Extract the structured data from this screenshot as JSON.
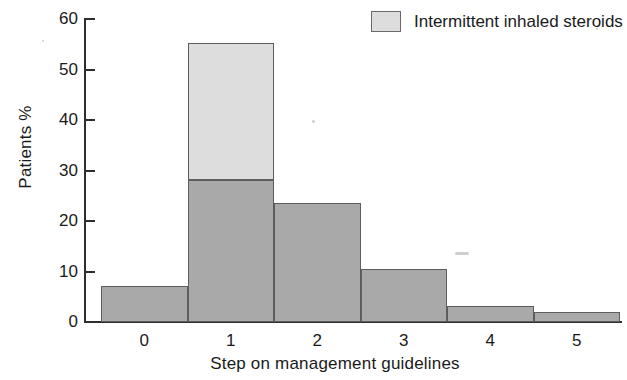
{
  "chart_data": {
    "type": "bar",
    "title": "",
    "subtitle": "",
    "xlabel": "Step on management guidelines",
    "ylabel": "Patients %",
    "categories": [
      "0",
      "1",
      "2",
      "3",
      "4",
      "5"
    ],
    "ylim": [
      0,
      60
    ],
    "yticks": [
      0,
      10,
      20,
      30,
      40,
      50,
      60
    ],
    "xticks": [
      "0",
      "1",
      "2",
      "3",
      "4",
      "5"
    ],
    "grid": false,
    "stacked": true,
    "legend_position": "top-right",
    "series": [
      {
        "name": "Regular treatment",
        "color": "#a9a9a9",
        "values": [
          7,
          28,
          23.3,
          10.2,
          3,
          1.8
        ]
      },
      {
        "name": "Intermittent inhaled steroids",
        "color": "#dddddd",
        "values": [
          0,
          27,
          0,
          0,
          0,
          0
        ]
      }
    ],
    "totals": [
      7,
      55,
      23.3,
      10.2,
      3,
      1.8
    ],
    "annotations": []
  },
  "legend": {
    "entries": [
      {
        "label": "Intermittent inhaled steroids",
        "swatch_color": "#dddddd"
      }
    ]
  },
  "axis": {
    "y_title": "Patients %",
    "x_title": "Step on management guidelines",
    "y_tick_labels": [
      "60",
      "50",
      "40",
      "30",
      "20",
      "10",
      "0"
    ],
    "x_tick_labels": [
      "0",
      "1",
      "2",
      "3",
      "4",
      "5"
    ]
  },
  "colors": {
    "bar_dark": "#a9a9a9",
    "bar_light": "#dddddd",
    "outline": "#5d5d5d",
    "axis": "#2e2e2e",
    "text": "#1a1a1a",
    "background": "#ffffff"
  }
}
